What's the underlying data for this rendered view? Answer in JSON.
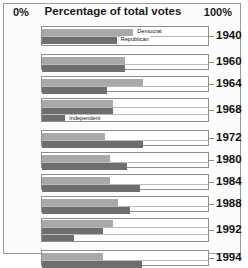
{
  "header": {
    "left_axis_label": "0%",
    "title": "Percentage of total votes",
    "right_axis_label": "100%"
  },
  "legend_labels": {
    "democrat": "Democrat",
    "republican": "Republican",
    "independent": "Independent"
  },
  "chart_data": {
    "type": "bar",
    "orientation": "horizontal",
    "title": "Percentage of total votes",
    "xlabel": "Percentage of total votes",
    "ylabel": "",
    "xlim": [
      0,
      100
    ],
    "xtick_labels": [
      "0%",
      "100%"
    ],
    "grid": false,
    "legend_position": "inline-annotation",
    "categories": [
      "1940",
      "1960",
      "1964",
      "1968",
      "1972",
      "1980",
      "1984",
      "1988",
      "1992",
      "1994"
    ],
    "series": [
      {
        "name": "Democrat",
        "color": "#a9a9a9",
        "values": [
          55,
          50,
          61,
          43,
          38,
          41,
          41,
          46,
          43,
          37
        ]
      },
      {
        "name": "Republican",
        "color": "#6e6e6e",
        "values": [
          45,
          50,
          39,
          43,
          61,
          51,
          59,
          53,
          37,
          60
        ]
      },
      {
        "name": "Independent",
        "color": "#6e6e6e",
        "values": [
          null,
          null,
          null,
          14,
          null,
          null,
          null,
          null,
          19,
          null
        ]
      }
    ],
    "annotations": [
      {
        "text": "Democrat",
        "category": "1940",
        "series": "Democrat"
      },
      {
        "text": "Republican",
        "category": "1940",
        "series": "Republican"
      },
      {
        "text": "Independent",
        "category": "1968",
        "series": "Independent"
      }
    ]
  }
}
